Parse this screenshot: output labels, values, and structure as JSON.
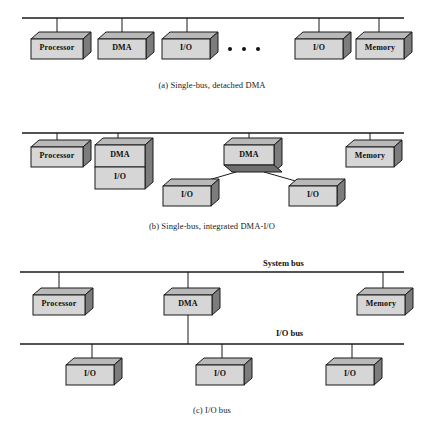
{
  "figure": {
    "colors": {
      "box_face": "#d4d4d4",
      "box_side": "#8f8f8f",
      "box_bottom": "#6e6e6e",
      "outline": "#1a1a1a",
      "line": "#1a1a1a",
      "background": "#ffffff"
    }
  },
  "panels": [
    {
      "id": "a",
      "caption": "(a) Single-bus, detached DMA",
      "bus": {
        "label": "",
        "y": 18
      },
      "nodes": [
        {
          "name": "Processor",
          "label": "Processor"
        },
        {
          "name": "DMA",
          "label": "DMA"
        },
        {
          "name": "I/O",
          "label": "I/O"
        },
        {
          "name": "ellipsis",
          "label": "• • •"
        },
        {
          "name": "I/O",
          "label": "I/O"
        },
        {
          "name": "Memory",
          "label": "Memory"
        }
      ]
    },
    {
      "id": "b",
      "caption": "(b) Single-bus, integrated DMA-I/O",
      "bus": {
        "label": "",
        "y": 133
      },
      "nodes": [
        {
          "name": "Processor",
          "label": "Processor"
        },
        {
          "name": "DMA-stacked-top",
          "label": "DMA"
        },
        {
          "name": "DMA-stacked-bottom",
          "label": "I/O"
        },
        {
          "name": "DMA-center",
          "label": "DMA"
        },
        {
          "name": "I/O-left-child",
          "label": "I/O"
        },
        {
          "name": "I/O-right-child",
          "label": "I/O"
        },
        {
          "name": "Memory",
          "label": "Memory"
        }
      ]
    },
    {
      "id": "c",
      "caption": "(c) I/O bus",
      "bus": {
        "label": "System bus",
        "y": 272
      },
      "bus2": {
        "label": "I/O bus",
        "y": 344
      },
      "nodes": [
        {
          "name": "Processor",
          "label": "Processor"
        },
        {
          "name": "DMA",
          "label": "DMA"
        },
        {
          "name": "Memory",
          "label": "Memory"
        },
        {
          "name": "I/O-1",
          "label": "I/O"
        },
        {
          "name": "I/O-2",
          "label": "I/O"
        },
        {
          "name": "I/O-3",
          "label": "I/O"
        }
      ]
    }
  ],
  "labels": {
    "processor": "Processor",
    "dma": "DMA",
    "io": "I/O",
    "memory": "Memory",
    "system_bus": "System bus",
    "io_bus": "I/O bus",
    "caption_a": "(a) Single-bus, detached DMA",
    "caption_b": "(b) Single-bus, integrated DMA-I/O",
    "caption_c": "(c) I/O bus"
  }
}
